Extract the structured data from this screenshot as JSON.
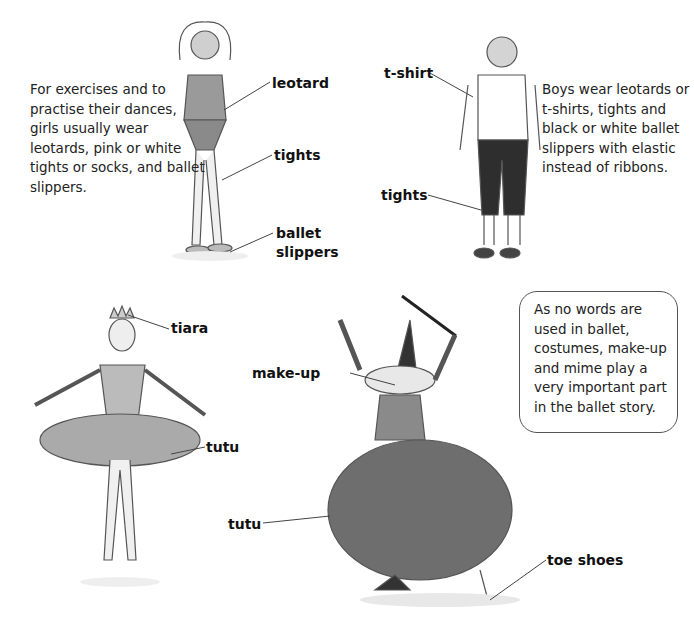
{
  "sections": {
    "girls": {
      "description": "For exercises and to practise their dances, girls usually wear leotards, pink or white tights or socks, and ballet slippers.",
      "labels": {
        "leotard": "leotard",
        "tights": "tights",
        "ballet_slippers_1": "ballet",
        "ballet_slippers_2": "slippers"
      }
    },
    "boys": {
      "description": "Boys wear leotards or t-shirts, tights and black or white ballet slippers with elastic instead of ribbons.",
      "labels": {
        "t_shirt": "t-shirt",
        "tights": "tights"
      }
    },
    "ballerina": {
      "labels": {
        "tiara": "tiara",
        "tutu": "tutu"
      }
    },
    "witch": {
      "labels": {
        "make_up": "make-up",
        "tutu": "tutu",
        "toe_shoes": "toe shoes"
      }
    },
    "callout": {
      "text": "As no words are used in ballet, costumes, make-up and mime play a very important part in the ballet story."
    }
  },
  "colors": {
    "ink": "#111111",
    "pencil": "#555555",
    "fill_light": "#d8d8d8",
    "fill_dark": "#3a3a3a"
  }
}
